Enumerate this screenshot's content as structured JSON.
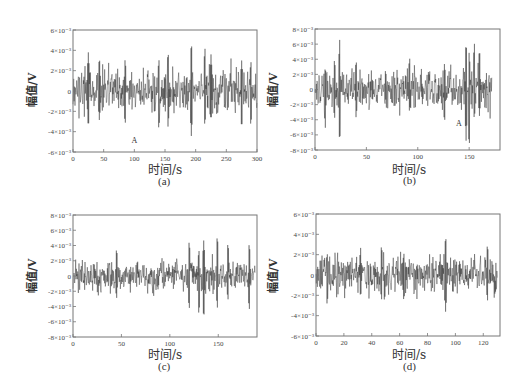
{
  "chart_data": [
    {
      "id": "a",
      "type": "line",
      "caption": "(a)",
      "xlabel": "时间/s",
      "ylabel": "幅值/V",
      "xlim": [
        0,
        300
      ],
      "ylim": [
        -0.006,
        0.006
      ],
      "xticks": [
        0,
        50,
        100,
        150,
        200,
        250,
        300
      ],
      "yticks": [
        -0.006,
        -0.004,
        -0.002,
        0,
        0.002,
        0.004,
        0.006
      ],
      "ytick_labels": [
        "-6×10⁻³",
        "-4×10⁻³",
        "-2×10⁻³",
        "0",
        "2×10⁻³",
        "4×10⁻³",
        "6×10⁻³"
      ],
      "grid": false,
      "annotation": {
        "text": "A",
        "x": 100,
        "y": -0.0051
      },
      "signal": {
        "duration": 300,
        "noise_std": 0.0011,
        "seed": 11,
        "spikes": [
          [
            25,
            0.0038,
            -0.0037
          ],
          [
            43,
            0.0034,
            -0.0029
          ],
          [
            85,
            0.0032,
            -0.0034
          ],
          [
            140,
            0.0032,
            -0.0039
          ],
          [
            155,
            0.004,
            -0.0036
          ],
          [
            193,
            0.005,
            -0.0045
          ],
          [
            215,
            0.0044,
            -0.0035
          ],
          [
            225,
            0.0036,
            -0.003
          ],
          [
            275,
            0.003,
            -0.0038
          ],
          [
            290,
            0.003,
            -0.0035
          ]
        ]
      }
    },
    {
      "id": "b",
      "type": "line",
      "caption": "(b)",
      "xlabel": "时间/s",
      "ylabel": "幅值/V",
      "xlim": [
        0,
        180
      ],
      "ylim": [
        -0.008,
        0.008
      ],
      "xticks": [
        0,
        50,
        100,
        150
      ],
      "yticks": [
        -0.008,
        -0.006,
        -0.004,
        -0.002,
        0,
        0.002,
        0.004,
        0.006,
        0.008
      ],
      "ytick_labels": [
        "-8×10⁻³",
        "-6×10⁻³",
        "-4×10⁻³",
        "-2×10⁻³",
        "0",
        "2×10⁻³",
        "4×10⁻³",
        "6×10⁻³",
        "8×10⁻³"
      ],
      "grid": false,
      "annotation": {
        "text": "A",
        "x": 140,
        "y": -0.0048
      },
      "signal": {
        "duration": 172,
        "noise_std": 0.0013,
        "seed": 23,
        "spikes": [
          [
            10,
            0.003,
            -0.0052
          ],
          [
            19,
            0.0041,
            -0.004
          ],
          [
            24,
            0.0066,
            -0.0073
          ],
          [
            40,
            0.004,
            -0.0038
          ],
          [
            92,
            0.0044,
            -0.003
          ],
          [
            126,
            0.0035,
            -0.0045
          ],
          [
            147,
            0.0065,
            -0.0068
          ],
          [
            150,
            0.005,
            -0.008
          ],
          [
            155,
            0.0064,
            -0.004
          ],
          [
            160,
            0.0056,
            -0.0035
          ]
        ]
      }
    },
    {
      "id": "c",
      "type": "line",
      "caption": "(c)",
      "xlabel": "时间/s",
      "ylabel": "幅值/V",
      "xlim": [
        0,
        190
      ],
      "ylim": [
        -0.008,
        0.008
      ],
      "xticks": [
        0,
        50,
        100,
        150
      ],
      "yticks": [
        -0.008,
        -0.006,
        -0.004,
        -0.002,
        0,
        0.002,
        0.004,
        0.006,
        0.008
      ],
      "ytick_labels": [
        "-8×10⁻³",
        "-6×10⁻³",
        "-4×10⁻³",
        "-2×10⁻³",
        "0",
        "2×10⁻³",
        "4×10⁻³",
        "6×10⁻³",
        "8×10⁻³"
      ],
      "grid": false,
      "annotation": null,
      "signal": {
        "duration": 188,
        "noise_std": 0.001,
        "seed": 37,
        "spikes": [
          [
            45,
            0.0037,
            -0.003
          ],
          [
            120,
            0.0047,
            -0.0045
          ],
          [
            130,
            0.0035,
            -0.0052
          ],
          [
            135,
            0.0047,
            -0.0058
          ],
          [
            149,
            0.0055,
            -0.0043
          ],
          [
            160,
            0.0045,
            -0.0032
          ],
          [
            182,
            0.0044,
            -0.0046
          ]
        ]
      }
    },
    {
      "id": "d",
      "type": "line",
      "caption": "(d)",
      "xlabel": "时间/s",
      "ylabel": "幅值/V",
      "xlim": [
        0,
        132
      ],
      "ylim": [
        -0.006,
        0.006
      ],
      "xticks": [
        0,
        20,
        40,
        60,
        80,
        100,
        120
      ],
      "yticks": [
        -0.006,
        -0.004,
        -0.002,
        0,
        0.002,
        0.004,
        0.006
      ],
      "ytick_labels": [
        "-6×10⁻³",
        "-4×10⁻³",
        "-2×10⁻³",
        "0",
        "2×10⁻³",
        "4×10⁻³",
        "6×10⁻³"
      ],
      "grid": false,
      "annotation": null,
      "signal": {
        "duration": 130,
        "noise_std": 0.0009,
        "seed": 51,
        "spikes": [
          [
            8,
            0.0022,
            -0.003
          ],
          [
            32,
            0.0027,
            -0.0022
          ],
          [
            47,
            0.003,
            -0.0025
          ],
          [
            63,
            0.0022,
            -0.0026
          ],
          [
            93,
            0.004,
            -0.0037
          ],
          [
            123,
            0.0031,
            -0.0026
          ]
        ]
      }
    }
  ],
  "style": {
    "line_color": "#1a1a1a",
    "axis_color": "#777777",
    "text_color": "#333333"
  }
}
